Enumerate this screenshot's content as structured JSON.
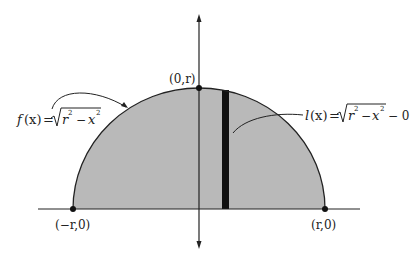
{
  "diagram": {
    "type": "semicircle-area-diagram",
    "colors": {
      "fill": "#b9b9b9",
      "stroke": "#222222",
      "strip": "#111111",
      "background": "#ffffff"
    },
    "points": {
      "top": "(0,r)",
      "left": "(−r,0)",
      "right": "(r,0)"
    },
    "labels": {
      "f_name": "f",
      "f_arg": "(x)",
      "f_eq": "=",
      "f_radicand_r": "r",
      "f_exp1": "2",
      "f_minus": "−",
      "f_radicand_x": "x",
      "f_exp2": "2",
      "l_name": "l",
      "l_arg": "(x)",
      "l_eq": "=",
      "l_radicand_r": "r",
      "l_exp1": "2",
      "l_minus": "−",
      "l_radicand_x": "x",
      "l_exp2": "2",
      "l_tail": "− 0"
    },
    "full_labels": {
      "f": "f(x) = √(r² − x²)",
      "l": "l(x) = √(r² − x²) − 0"
    }
  }
}
